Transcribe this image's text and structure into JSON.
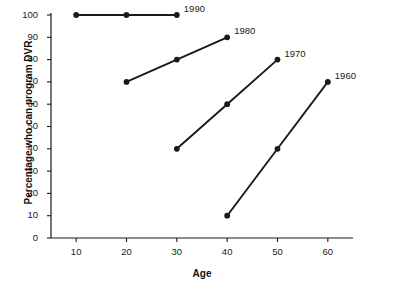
{
  "chart_data": {
    "type": "line",
    "title": "",
    "xlabel": "Age",
    "ylabel": "Percentage who can program DVR",
    "xlim": [
      5,
      65
    ],
    "ylim": [
      0,
      100
    ],
    "xticks": [
      10,
      20,
      30,
      40,
      50,
      60
    ],
    "yticks": [
      0,
      10,
      20,
      30,
      40,
      50,
      60,
      70,
      80,
      90,
      100
    ],
    "grid": false,
    "legend_position": "inline-right-of-series",
    "marker": "filled-circle",
    "line_color": "#1a1a1a",
    "series": [
      {
        "name": "1990",
        "label": "1990",
        "x": [
          10,
          20,
          30
        ],
        "values": [
          100,
          100,
          100
        ],
        "label_x": 30,
        "label_y": 100
      },
      {
        "name": "1980",
        "label": "1980",
        "x": [
          20,
          30,
          40
        ],
        "values": [
          70,
          80,
          90
        ],
        "label_x": 40,
        "label_y": 90
      },
      {
        "name": "1970",
        "label": "1970",
        "x": [
          30,
          40,
          50
        ],
        "values": [
          40,
          60,
          80
        ],
        "label_x": 50,
        "label_y": 80
      },
      {
        "name": "1960",
        "label": "1960",
        "x": [
          40,
          50,
          60
        ],
        "values": [
          10,
          40,
          70
        ],
        "label_x": 60,
        "label_y": 70
      }
    ]
  }
}
